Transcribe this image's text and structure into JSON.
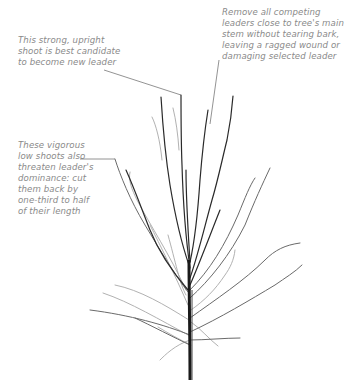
{
  "diagram": {
    "callouts": [
      {
        "id": "new-leader",
        "lines": [
          "This strong, upright",
          "shoot is best candidate",
          "to become new leader"
        ]
      },
      {
        "id": "remove-competing",
        "lines": [
          "Remove all competing",
          "leaders close to tree's main",
          "stem without tearing bark,",
          "leaving a ragged wound or",
          "damaging selected leader"
        ]
      },
      {
        "id": "low-shoots",
        "lines": [
          "These vigorous",
          "low shoots also",
          "threaten leader's",
          "dominance: cut",
          "them back by",
          "one-third to half",
          "of their length"
        ]
      }
    ],
    "colors": {
      "text": "#8a8a8a",
      "leader_line": "#777777",
      "branch_dark": "#2a2a2a",
      "branch_light": "#9a9a9a"
    }
  }
}
